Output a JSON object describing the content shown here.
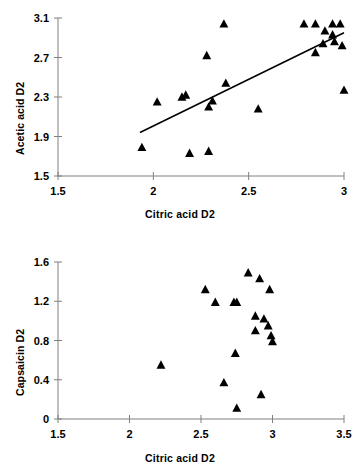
{
  "figure": {
    "panels": [
      "acetic-acid-panel",
      "capsaicin-panel"
    ]
  },
  "chart_data": [
    {
      "type": "scatter",
      "name": "acetic-vs-citric",
      "title": "",
      "xlabel": "Citric acid D2",
      "ylabel": "Acetic acid D2",
      "xlim": [
        1.5,
        3.0
      ],
      "ylim": [
        1.5,
        3.1
      ],
      "xticks": [
        1.5,
        2,
        2.5,
        3
      ],
      "xticklabels": [
        "1.5",
        "2",
        "2.5",
        "3"
      ],
      "yticks": [
        1.5,
        1.9,
        2.3,
        2.7,
        3.1
      ],
      "yticklabels": [
        "1.5",
        "1.9",
        "2.3",
        "2.7",
        "3.1"
      ],
      "grid": false,
      "legend": null,
      "marker": "triangle",
      "marker_color": "#000000",
      "points": [
        {
          "x": 1.94,
          "y": 1.79
        },
        {
          "x": 2.02,
          "y": 2.25
        },
        {
          "x": 2.15,
          "y": 2.3
        },
        {
          "x": 2.17,
          "y": 2.32
        },
        {
          "x": 2.19,
          "y": 1.73
        },
        {
          "x": 2.29,
          "y": 1.75
        },
        {
          "x": 2.28,
          "y": 2.72
        },
        {
          "x": 2.29,
          "y": 2.2
        },
        {
          "x": 2.31,
          "y": 2.26
        },
        {
          "x": 2.37,
          "y": 3.04
        },
        {
          "x": 2.38,
          "y": 2.44
        },
        {
          "x": 2.55,
          "y": 2.18
        },
        {
          "x": 2.79,
          "y": 3.04
        },
        {
          "x": 2.85,
          "y": 3.04
        },
        {
          "x": 2.85,
          "y": 2.75
        },
        {
          "x": 2.89,
          "y": 2.84
        },
        {
          "x": 2.9,
          "y": 2.97
        },
        {
          "x": 2.94,
          "y": 3.04
        },
        {
          "x": 2.94,
          "y": 2.93
        },
        {
          "x": 2.95,
          "y": 2.86
        },
        {
          "x": 2.98,
          "y": 3.04
        },
        {
          "x": 2.99,
          "y": 2.82
        },
        {
          "x": 3.0,
          "y": 2.37
        }
      ],
      "trendline": {
        "x0": 1.93,
        "y0": 1.94,
        "x1": 3.0,
        "y1": 2.95
      }
    },
    {
      "type": "scatter",
      "name": "capsaicin-vs-citric",
      "title": "",
      "xlabel": "Citric acid D2",
      "ylabel": "Capsaicin D2",
      "xlim": [
        1.5,
        3.5
      ],
      "ylim": [
        0,
        1.6
      ],
      "xticks": [
        1.5,
        2,
        2.5,
        3,
        3.5
      ],
      "xticklabels": [
        "1.5",
        "2",
        "2.5",
        "3",
        "3.5"
      ],
      "yticks": [
        0,
        0.4,
        0.8,
        1.2,
        1.6
      ],
      "yticklabels": [
        "0",
        "0.4",
        "0.8",
        "1.2",
        "1.6"
      ],
      "grid": false,
      "legend": null,
      "marker": "triangle",
      "marker_color": "#000000",
      "points": [
        {
          "x": 2.22,
          "y": 0.55
        },
        {
          "x": 2.53,
          "y": 1.32
        },
        {
          "x": 2.6,
          "y": 1.19
        },
        {
          "x": 2.66,
          "y": 0.37
        },
        {
          "x": 2.73,
          "y": 1.19
        },
        {
          "x": 2.75,
          "y": 1.19
        },
        {
          "x": 2.74,
          "y": 0.67
        },
        {
          "x": 2.75,
          "y": 0.11
        },
        {
          "x": 2.83,
          "y": 1.49
        },
        {
          "x": 2.88,
          "y": 1.05
        },
        {
          "x": 2.88,
          "y": 0.9
        },
        {
          "x": 2.91,
          "y": 1.43
        },
        {
          "x": 2.92,
          "y": 0.25
        },
        {
          "x": 2.94,
          "y": 1.02
        },
        {
          "x": 2.97,
          "y": 0.95
        },
        {
          "x": 2.98,
          "y": 1.32
        },
        {
          "x": 2.99,
          "y": 0.85
        },
        {
          "x": 3.0,
          "y": 0.79
        }
      ],
      "trendline": null
    }
  ]
}
